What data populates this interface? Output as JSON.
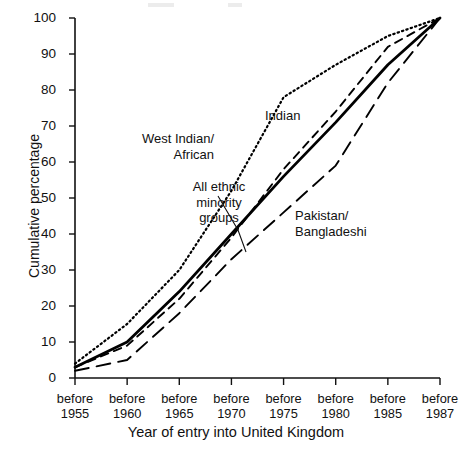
{
  "figure": {
    "xlabel": "Year of entry into United Kingdom",
    "ylabel": "Cumulative percentage"
  },
  "annotations": {
    "west_indian_african": {
      "line1": "West Indian/",
      "line2": "African"
    },
    "indian": {
      "line1": "Indian"
    },
    "all_ethnic": {
      "line1": "All ethnic",
      "line2": "minority",
      "line3": "groups"
    },
    "pakistan_bangladeshi": {
      "line1": "Pakistan/",
      "line2": "Bangladeshi"
    }
  },
  "xticks": [
    {
      "l1": "before",
      "l2": "1955"
    },
    {
      "l1": "before",
      "l2": "1960"
    },
    {
      "l1": "before",
      "l2": "1965"
    },
    {
      "l1": "before",
      "l2": "1970"
    },
    {
      "l1": "before",
      "l2": "1975"
    },
    {
      "l1": "before",
      "l2": "1980"
    },
    {
      "l1": "before",
      "l2": "1985"
    },
    {
      "l1": "before",
      "l2": "1987"
    }
  ],
  "yticks": [
    "100",
    "90",
    "80",
    "70",
    "60",
    "50",
    "40",
    "30",
    "20",
    "10",
    "0"
  ],
  "chart_data": {
    "type": "line",
    "title": "",
    "xlabel": "Year of entry into United Kingdom",
    "ylabel": "Cumulative percentage",
    "categories": [
      "before 1955",
      "before 1960",
      "before 1965",
      "before 1970",
      "before 1975",
      "before 1980",
      "before 1985",
      "before 1987"
    ],
    "ylim": [
      0,
      100
    ],
    "ytick_values": [
      0,
      10,
      20,
      30,
      40,
      50,
      60,
      70,
      80,
      90,
      100
    ],
    "grid": false,
    "legend": "inline-annotations",
    "series": [
      {
        "name": "West Indian/African",
        "style": "dotted",
        "color": "#000000",
        "values": [
          4,
          15,
          30,
          52,
          78,
          87,
          95,
          100
        ]
      },
      {
        "name": "All ethnic minority groups",
        "style": "solid",
        "color": "#000000",
        "values": [
          3,
          10,
          24,
          40,
          56,
          71,
          87,
          100
        ]
      },
      {
        "name": "Indian",
        "style": "dashed",
        "color": "#000000",
        "values": [
          3,
          9,
          22,
          39,
          58,
          74,
          92,
          100
        ]
      },
      {
        "name": "Pakistan/Bangladeshi",
        "style": "long-dash",
        "color": "#000000",
        "values": [
          2,
          5,
          18,
          33,
          46,
          59,
          82,
          100
        ]
      }
    ]
  }
}
